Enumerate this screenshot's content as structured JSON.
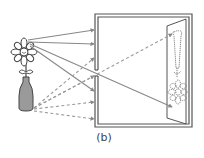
{
  "figure": {
    "caption": "(b)",
    "colors": {
      "line": "#555555",
      "ray": "#888888",
      "vase_fill": "#9a9a9a",
      "background": "#ffffff"
    },
    "elements": [
      {
        "name": "flower-in-vase",
        "role": "object"
      },
      {
        "name": "camera-box",
        "role": "camera with pinhole"
      },
      {
        "name": "image-screen",
        "role": "inverted projected image"
      }
    ]
  }
}
